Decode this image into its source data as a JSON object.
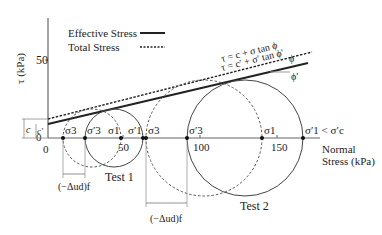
{
  "axes": {
    "y_label": "τ (kPa)",
    "y_ticks": [
      {
        "value": 50,
        "label": "50"
      }
    ],
    "x_label_line1": "Normal",
    "x_label_line2": "Stress (kPa)",
    "x_ticks": [
      {
        "value": 0,
        "label": "0"
      },
      {
        "value": 50,
        "label": "50"
      },
      {
        "value": 100,
        "label": "100"
      },
      {
        "value": 150,
        "label": "150"
      }
    ],
    "origin_y_label": "0"
  },
  "legend": {
    "effective": "Effective Stress",
    "total": "Total Stress"
  },
  "envelopes": {
    "total_eq": "τ = c + σ tan ϕ",
    "effective_eq": "τ = c′ + σ′ tan ϕ′",
    "phi_total": "ϕ",
    "phi_effective": "ϕ′",
    "c_label": "c",
    "c_prime_label": "c′"
  },
  "test1": {
    "label": "Test 1",
    "sigma3": "σ3",
    "sigma3_prime": "σ′3",
    "sigma1": "σ1",
    "sigma1_prime": "σ′1",
    "pore_label": "(−Δud)f",
    "sigma3_val": 10,
    "sigma3p_val": 24,
    "sigma1_val": 48,
    "sigma1p_val": 62
  },
  "test2": {
    "label": "Test 2",
    "sigma3": "σ3",
    "sigma3_prime": "σ′3",
    "sigma1": "σ1",
    "sigma1_prime_cmp": "σ′1 < σ′c",
    "pore_label": "(−Δud)f",
    "sigma3_val": 64,
    "sigma3p_val": 91,
    "sigma1_val": 140,
    "sigma1p_val": 166
  },
  "colors": {
    "line": "#222222",
    "circle": "#444444",
    "axis": "#666666"
  }
}
